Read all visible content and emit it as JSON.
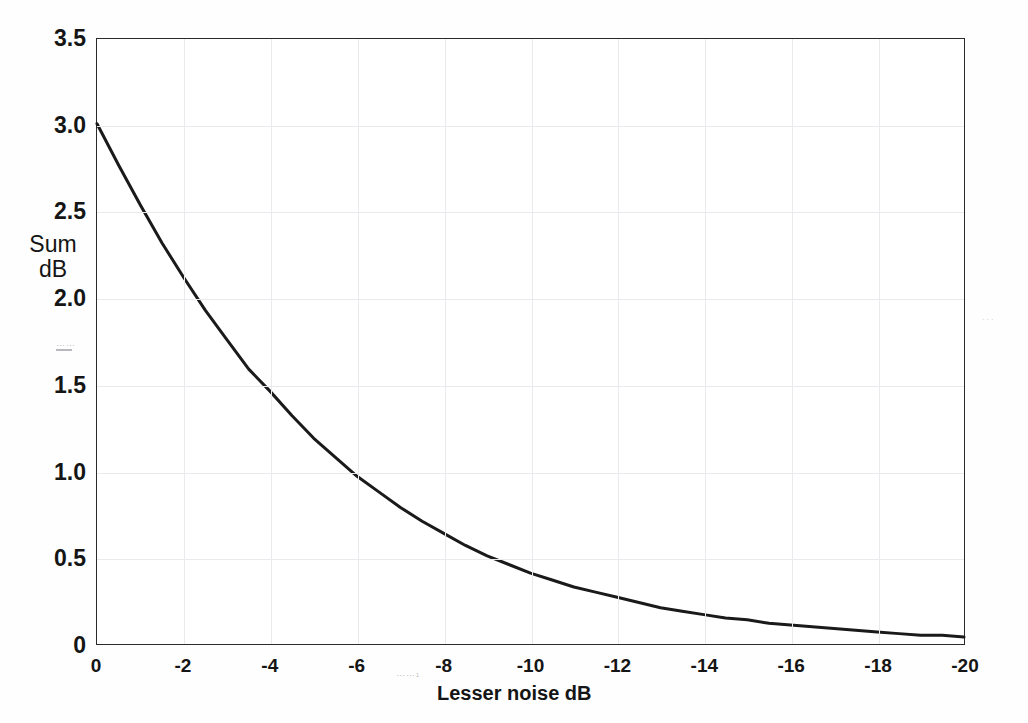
{
  "chart_data": {
    "type": "line",
    "title": "",
    "xlabel": "Lesser noise  dB",
    "ylabel": "Sum\ndB",
    "ylabel_line1": "Sum",
    "ylabel_line2": "dB",
    "xlim": [
      0,
      -20
    ],
    "ylim": [
      0,
      3.5
    ],
    "grid": true,
    "legend": null,
    "x_ticks": [
      "0",
      "-2",
      "-4",
      "-6",
      "-8",
      "-10",
      "-12",
      "-14",
      "-16",
      "-18",
      "-20"
    ],
    "x_tick_values": [
      0,
      -2,
      -4,
      -6,
      -8,
      -10,
      -12,
      -14,
      -16,
      -18,
      -20
    ],
    "y_ticks": [
      "0",
      "0.5",
      "1.0",
      "1.5",
      "2.0",
      "2.5",
      "3.0",
      "3.5"
    ],
    "y_tick_values": [
      0,
      0.5,
      1.0,
      1.5,
      2.0,
      2.5,
      3.0,
      3.5
    ],
    "series": [
      {
        "name": "Sum dB",
        "color": "#1a1a1a",
        "x": [
          0,
          -0.5,
          -1,
          -1.5,
          -2,
          -2.5,
          -3,
          -3.5,
          -4,
          -4.5,
          -5,
          -5.5,
          -6,
          -6.5,
          -7,
          -7.5,
          -8,
          -8.5,
          -9,
          -9.5,
          -10,
          -10.5,
          -11,
          -11.5,
          -12,
          -12.5,
          -13,
          -13.5,
          -14,
          -14.5,
          -15,
          -15.5,
          -16,
          -16.5,
          -17,
          -17.5,
          -18,
          -18.5,
          -19,
          -19.5,
          -20
        ],
        "values": [
          3.01,
          2.77,
          2.54,
          2.32,
          2.12,
          1.93,
          1.76,
          1.59,
          1.46,
          1.32,
          1.19,
          1.08,
          0.97,
          0.88,
          0.79,
          0.71,
          0.64,
          0.57,
          0.51,
          0.46,
          0.41,
          0.37,
          0.33,
          0.3,
          0.27,
          0.24,
          0.21,
          0.19,
          0.17,
          0.15,
          0.14,
          0.12,
          0.11,
          0.1,
          0.09,
          0.08,
          0.07,
          0.06,
          0.05,
          0.05,
          0.04
        ]
      }
    ],
    "annotations": [
      {
        "name": "scan-artifact-y-axis",
        "text": ""
      },
      {
        "name": "scan-artifact-x-axis",
        "text": ""
      },
      {
        "name": "scan-artifact-right-margin",
        "text": "..."
      }
    ]
  }
}
